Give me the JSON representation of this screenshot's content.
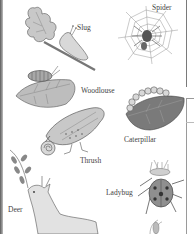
{
  "illustration": {
    "labels": {
      "slug": "Slug",
      "spider": "Spider",
      "woodlouse": "Woodlouse",
      "thrush": "Thrush",
      "caterpillar": "Caterpillar",
      "deer": "Deer",
      "ladybug": "Ladybug"
    },
    "colors": {
      "ink": "#444444",
      "fill_light": "#cfcfcf",
      "fill_mid": "#9a9a9a",
      "fill_dark": "#5e5e5e",
      "background": "#ffffff"
    }
  }
}
